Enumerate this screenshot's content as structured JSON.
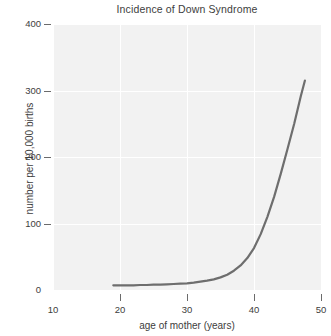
{
  "chart_data": {
    "type": "line",
    "title": "Incidence of Down Syndrome",
    "xlabel": "age of mother (years)",
    "ylabel": "number per 10,000 births",
    "xlim": [
      10,
      50
    ],
    "ylim": [
      0,
      400
    ],
    "xticks": [
      10,
      20,
      30,
      40,
      50
    ],
    "xtick_labels": [
      "10",
      "20",
      "30",
      "40",
      "50"
    ],
    "yticks": [
      0,
      100,
      200,
      300,
      400
    ],
    "ytick_labels": [
      "0",
      "100",
      "200",
      "300",
      "400"
    ],
    "grid": true,
    "grid_color": "#ffffff",
    "plot_bg": "#f2f2f2",
    "legend": null,
    "series": [
      {
        "name": "incidence",
        "color": "#6e6e6e",
        "line_width": 2.2,
        "x": [
          19,
          20,
          21,
          22,
          23,
          24,
          25,
          26,
          27,
          28,
          29,
          30,
          31,
          32,
          33,
          34,
          35,
          36,
          37,
          38,
          39,
          40,
          41,
          42,
          43,
          44,
          45,
          46,
          47,
          47.6
        ],
        "y": [
          7,
          7,
          7,
          7,
          7.5,
          7.5,
          8,
          8,
          8.5,
          9,
          9.5,
          10,
          11,
          12.5,
          14,
          16,
          19,
          23,
          29,
          37,
          48,
          63,
          84,
          110,
          140,
          175,
          212,
          250,
          292,
          315
        ]
      }
    ]
  },
  "figure": {
    "width": 325,
    "height": 336,
    "background": "#ffffff",
    "axis_color": "#6b6b6b",
    "text_color": "#3d3d3d"
  }
}
